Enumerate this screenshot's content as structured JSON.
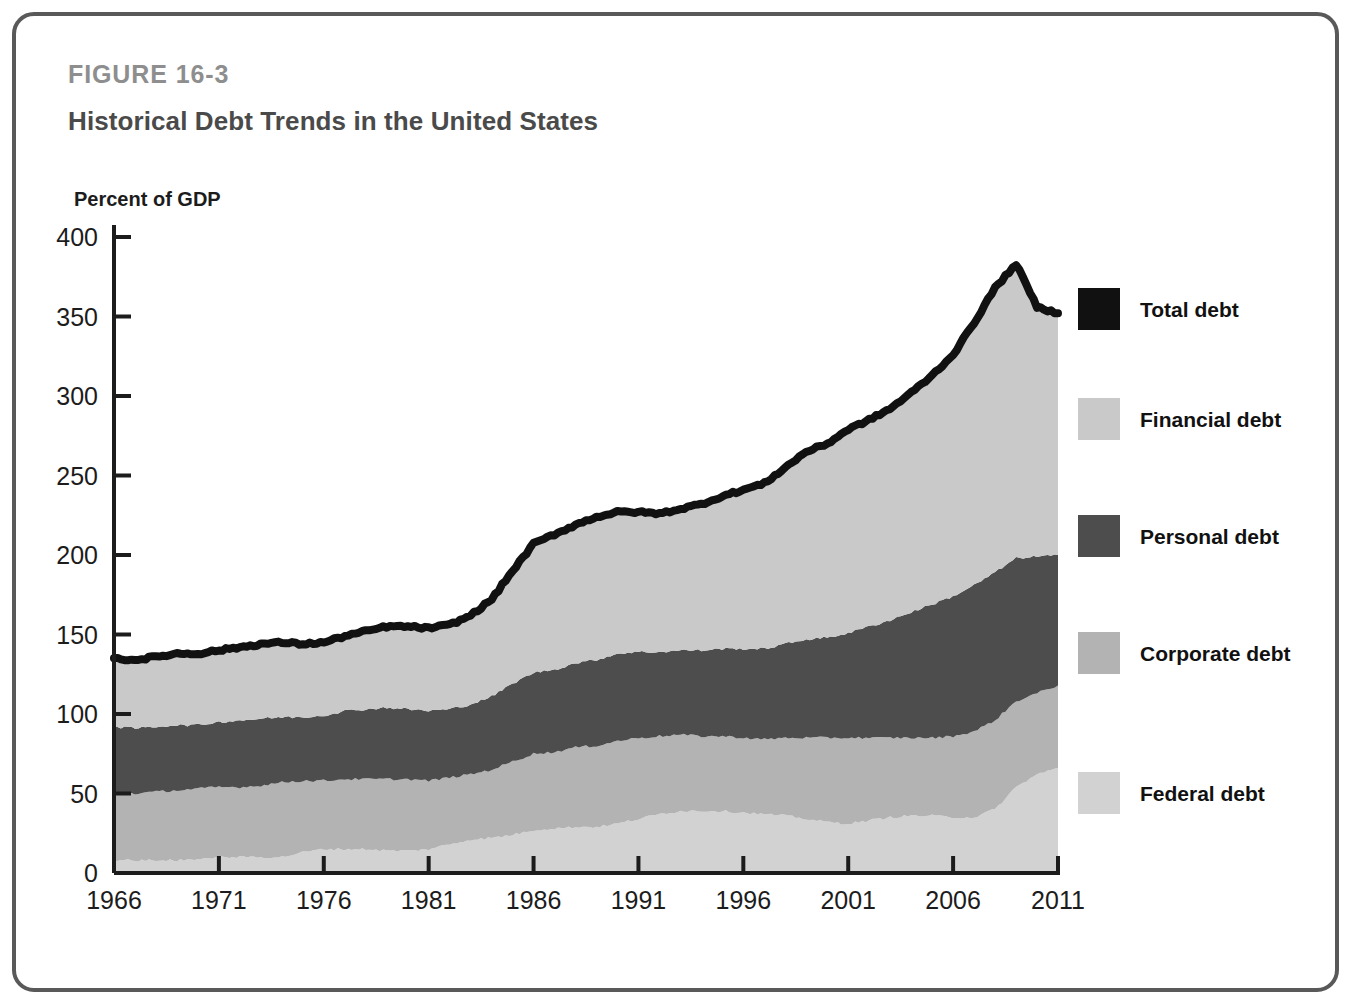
{
  "figure": {
    "number": "FIGURE 16-3",
    "title": "Historical Debt Trends in the United States",
    "axis_unit_label": "Percent of GDP",
    "border_color": "#595959"
  },
  "legend": {
    "items": [
      {
        "label": "Total debt",
        "color": "#111111",
        "swatch_name": "legend-swatch-total-debt"
      },
      {
        "label": "Financial debt",
        "color": "#c9c9c9",
        "swatch_name": "legend-swatch-financial-debt"
      },
      {
        "label": "Personal debt",
        "color": "#4d4d4d",
        "swatch_name": "legend-swatch-personal-debt"
      },
      {
        "label": "Corporate debt",
        "color": "#b3b3b3",
        "swatch_name": "legend-swatch-corporate-debt"
      },
      {
        "label": "Federal debt",
        "color": "#d2d2d2",
        "swatch_name": "legend-swatch-federal-debt"
      }
    ]
  },
  "chart_data": {
    "type": "area",
    "stacked": true,
    "title": "Historical Debt Trends in the United States",
    "xlabel": "",
    "ylabel": "Percent of GDP",
    "xlim": [
      1966,
      2011
    ],
    "ylim": [
      0,
      400
    ],
    "xticks": [
      1966,
      1971,
      1976,
      1981,
      1986,
      1991,
      1996,
      2001,
      2006,
      2011
    ],
    "yticks": [
      0,
      50,
      100,
      150,
      200,
      250,
      300,
      350,
      400
    ],
    "grid": false,
    "legend_position": "right",
    "x": [
      1966,
      1967,
      1968,
      1969,
      1970,
      1971,
      1972,
      1973,
      1974,
      1975,
      1976,
      1977,
      1978,
      1979,
      1980,
      1981,
      1982,
      1983,
      1984,
      1985,
      1986,
      1987,
      1988,
      1989,
      1990,
      1991,
      1992,
      1993,
      1994,
      1995,
      1996,
      1997,
      1998,
      1999,
      2000,
      2001,
      2002,
      2003,
      2004,
      2005,
      2006,
      2007,
      2008,
      2009,
      2010,
      2011
    ],
    "series": [
      {
        "name": "Federal debt",
        "color": "#d2d2d2",
        "values": [
          8,
          8,
          8,
          8,
          9,
          10,
          10,
          10,
          10,
          13,
          15,
          15,
          15,
          14,
          14,
          15,
          18,
          21,
          22,
          24,
          27,
          28,
          29,
          29,
          31,
          34,
          37,
          39,
          39,
          39,
          38,
          37,
          36,
          34,
          32,
          31,
          33,
          35,
          36,
          36,
          35,
          35,
          40,
          54,
          62,
          66
        ]
      },
      {
        "name": "Corporate debt",
        "color": "#b3b3b3",
        "values": [
          42,
          42,
          43,
          44,
          44,
          44,
          44,
          45,
          47,
          45,
          43,
          44,
          44,
          45,
          45,
          43,
          42,
          41,
          43,
          46,
          48,
          48,
          50,
          51,
          52,
          51,
          49,
          48,
          47,
          47,
          47,
          47,
          49,
          51,
          53,
          54,
          52,
          50,
          49,
          49,
          51,
          54,
          56,
          54,
          51,
          52
        ]
      },
      {
        "name": "Personal debt",
        "color": "#4d4d4d",
        "values": [
          42,
          41,
          41,
          41,
          40,
          41,
          42,
          42,
          41,
          40,
          41,
          43,
          44,
          45,
          44,
          44,
          43,
          44,
          46,
          49,
          51,
          52,
          53,
          54,
          55,
          54,
          53,
          53,
          54,
          55,
          56,
          57,
          59,
          62,
          63,
          66,
          70,
          74,
          79,
          84,
          88,
          92,
          93,
          90,
          86,
          82
        ]
      },
      {
        "name": "Financial debt",
        "color": "#c9c9c9",
        "values": [
          43,
          43,
          44,
          45,
          45,
          45,
          46,
          47,
          47,
          46,
          46,
          47,
          49,
          51,
          52,
          52,
          53,
          56,
          61,
          71,
          81,
          85,
          87,
          90,
          89,
          88,
          87,
          89,
          92,
          96,
          100,
          104,
          111,
          118,
          122,
          128,
          130,
          133,
          138,
          144,
          152,
          165,
          179,
          185,
          157,
          152
        ]
      }
    ],
    "total_line": {
      "name": "Total debt",
      "color": "#111111",
      "values": [
        135,
        134,
        136,
        138,
        138,
        140,
        142,
        144,
        145,
        144,
        145,
        149,
        152,
        155,
        155,
        154,
        156,
        162,
        172,
        190,
        207,
        213,
        219,
        224,
        227,
        227,
        226,
        229,
        232,
        237,
        241,
        245,
        255,
        265,
        270,
        279,
        285,
        292,
        302,
        313,
        326,
        346,
        368,
        383,
        356,
        352
      ]
    }
  }
}
